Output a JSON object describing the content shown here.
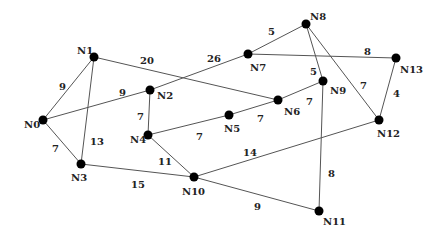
{
  "graph": {
    "nodes": [
      {
        "id": "N0",
        "x": 43,
        "y": 120,
        "lx": 24,
        "ly": 128
      },
      {
        "id": "N1",
        "x": 94,
        "y": 57,
        "lx": 77,
        "ly": 54
      },
      {
        "id": "N2",
        "x": 150,
        "y": 90,
        "lx": 157,
        "ly": 99
      },
      {
        "id": "N3",
        "x": 81,
        "y": 164,
        "lx": 71,
        "ly": 181
      },
      {
        "id": "N4",
        "x": 148,
        "y": 135,
        "lx": 130,
        "ly": 143
      },
      {
        "id": "N5",
        "x": 229,
        "y": 115,
        "lx": 224,
        "ly": 132
      },
      {
        "id": "N6",
        "x": 278,
        "y": 100,
        "lx": 284,
        "ly": 115
      },
      {
        "id": "N7",
        "x": 248,
        "y": 54,
        "lx": 250,
        "ly": 71
      },
      {
        "id": "N8",
        "x": 306,
        "y": 24,
        "lx": 310,
        "ly": 20
      },
      {
        "id": "N9",
        "x": 323,
        "y": 81,
        "lx": 330,
        "ly": 94
      },
      {
        "id": "N10",
        "x": 194,
        "y": 177,
        "lx": 182,
        "ly": 195
      },
      {
        "id": "N11",
        "x": 319,
        "y": 211,
        "lx": 323,
        "ly": 225
      },
      {
        "id": "N12",
        "x": 379,
        "y": 120,
        "lx": 377,
        "ly": 137
      },
      {
        "id": "N13",
        "x": 396,
        "y": 58,
        "lx": 400,
        "ly": 73
      }
    ],
    "edges": [
      {
        "from": "N0",
        "to": "N1",
        "weight": "9",
        "lx": 59,
        "ly": 90
      },
      {
        "from": "N0",
        "to": "N2",
        "weight": "9",
        "lx": 119,
        "ly": 96
      },
      {
        "from": "N0",
        "to": "N3",
        "weight": "7",
        "lx": 52,
        "ly": 152
      },
      {
        "from": "N1",
        "to": "N3",
        "weight": "13",
        "lx": 90,
        "ly": 145
      },
      {
        "from": "N1",
        "to": "N6",
        "weight": "20",
        "lx": 140,
        "ly": 64
      },
      {
        "from": "N2",
        "to": "N7",
        "weight": "26",
        "lx": 207,
        "ly": 62
      },
      {
        "from": "N2",
        "to": "N4",
        "weight": "7",
        "lx": 137,
        "ly": 120
      },
      {
        "from": "N4",
        "to": "N5",
        "weight": "7",
        "lx": 196,
        "ly": 140
      },
      {
        "from": "N4",
        "to": "N10",
        "weight": "11",
        "lx": 158,
        "ly": 165
      },
      {
        "from": "N3",
        "to": "N10",
        "weight": "15",
        "lx": 131,
        "ly": 188
      },
      {
        "from": "N5",
        "to": "N6",
        "weight": "7",
        "lx": 257,
        "ly": 122
      },
      {
        "from": "N6",
        "to": "N9",
        "weight": "7",
        "lx": 306,
        "ly": 105
      },
      {
        "from": "N7",
        "to": "N8",
        "weight": "5",
        "lx": 268,
        "ly": 35
      },
      {
        "from": "N7",
        "to": "N13",
        "weight": "8",
        "lx": 364,
        "ly": 55
      },
      {
        "from": "N8",
        "to": "N9",
        "weight": "5",
        "lx": 310,
        "ly": 75
      },
      {
        "from": "N8",
        "to": "N12",
        "weight": "7",
        "lx": 360,
        "ly": 89
      },
      {
        "from": "N13",
        "to": "N12",
        "weight": "4",
        "lx": 393,
        "ly": 97
      },
      {
        "from": "N9",
        "to": "N11",
        "weight": "8",
        "lx": 328,
        "ly": 177
      },
      {
        "from": "N10",
        "to": "N12",
        "weight": "14",
        "lx": 243,
        "ly": 156
      },
      {
        "from": "N10",
        "to": "N11",
        "weight": "9",
        "lx": 254,
        "ly": 210
      }
    ]
  }
}
